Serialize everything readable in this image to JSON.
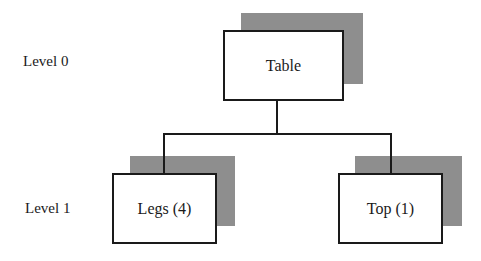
{
  "diagram": {
    "type": "hierarchy-tree",
    "levels": [
      {
        "label": "Level 0"
      },
      {
        "label": "Level 1"
      }
    ],
    "nodes": {
      "root": {
        "label": "Table",
        "level": 0
      },
      "children": [
        {
          "label": "Legs (4)",
          "level": 1
        },
        {
          "label": "Top (1)",
          "level": 1
        }
      ]
    },
    "edges": [
      {
        "from": "Table",
        "to": "Legs (4)"
      },
      {
        "from": "Table",
        "to": "Top (1)"
      }
    ],
    "colors": {
      "stroke": "#1a1a1a",
      "shadow": "#c8c8c8",
      "background": "#ffffff"
    }
  }
}
